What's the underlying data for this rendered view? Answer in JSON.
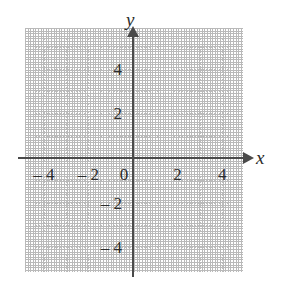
{
  "figure": {
    "kind": "cartesian-coordinate-plane",
    "axis_labels": {
      "x": "x",
      "y": "y"
    },
    "colors": {
      "axis": "#4a4a4a",
      "grid": "#bdbdbd",
      "text": "#2b2b2b",
      "background": "#ffffff"
    }
  },
  "chart_data": {
    "type": "scatter",
    "title": "",
    "subtitle": "",
    "xlabel": "x",
    "ylabel": "y",
    "xlim": [
      -5,
      5.3
    ],
    "ylim": [
      -5.8,
      4.9
    ],
    "xticks": [
      -4,
      -2,
      0,
      2,
      4
    ],
    "yticks": [
      4,
      2,
      -2,
      -4
    ],
    "xtick_labels": [
      "– 4",
      "– 2",
      "0",
      "2",
      "4"
    ],
    "ytick_labels": [
      "4",
      "2",
      "– 2",
      "– 4"
    ],
    "grid": true,
    "grid_style": "dotted",
    "grid_spacing": 1,
    "legend": null,
    "series": [],
    "values": [],
    "annotations": [],
    "note": "Empty coordinate grid with no plotted points or curves"
  },
  "ticks": {
    "x": [
      {
        "value": -4,
        "label": "– 4"
      },
      {
        "value": -2,
        "label": "– 2"
      },
      {
        "value": 0,
        "label": "0"
      },
      {
        "value": 2,
        "label": "2"
      },
      {
        "value": 4,
        "label": "4"
      }
    ],
    "y": [
      {
        "value": 4,
        "label": "4"
      },
      {
        "value": 2,
        "label": "2"
      },
      {
        "value": -2,
        "label": "– 2"
      },
      {
        "value": -4,
        "label": "– 4"
      }
    ]
  }
}
